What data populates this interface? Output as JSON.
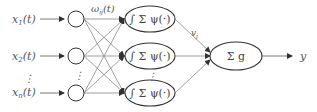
{
  "diagram": {
    "inputs": [
      {
        "label": "x",
        "sub": "1",
        "arg": "(t)"
      },
      {
        "label": "x",
        "sub": "2",
        "arg": "(t)"
      },
      {
        "label": "x",
        "sub": "n",
        "arg": "(t)"
      }
    ],
    "input_ellipsis": "⋮",
    "hidden_ellipsis": "⋮",
    "hidden_node_label": "∫ Σ ψ(·)",
    "output_node_label": "Σ g",
    "input_weight_label": {
      "main": "ω",
      "sub": "ij",
      "arg": "(t)"
    },
    "output_weight_label": {
      "main": "v",
      "sub": "j"
    },
    "output_label": "y",
    "colors": {
      "stroke": "#333333",
      "edge": "#777777",
      "text": "#555555"
    }
  }
}
